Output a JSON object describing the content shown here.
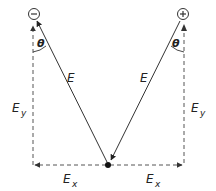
{
  "diagram": {
    "charges": {
      "negative": {
        "symbol": "−",
        "label": "negative charge"
      },
      "positive": {
        "symbol": "+",
        "label": "positive charge"
      }
    },
    "labels": {
      "theta_left": "θ",
      "theta_right": "θ",
      "E_left": "E",
      "E_right": "E",
      "Ey_left_main": "E",
      "Ey_left_sub": "y",
      "Ey_right_main": "E",
      "Ey_right_sub": "y",
      "Ex_left_main": "E",
      "Ex_left_sub": "x",
      "Ex_right_main": "E",
      "Ex_right_sub": "x"
    },
    "colors": {
      "line": "#333333",
      "dashed": "#666666",
      "point": "#111111"
    }
  }
}
